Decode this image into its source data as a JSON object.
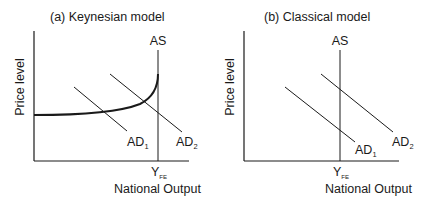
{
  "panels": [
    {
      "id": "a",
      "title": "(a)  Keynesian model",
      "y_axis_label": "Price level",
      "x_axis_label": "National Output",
      "as_label": "AS",
      "x_tick": {
        "main": "Y",
        "sub": "FE"
      },
      "ad_labels": [
        {
          "main": "AD",
          "sub": "1"
        },
        {
          "main": "AD",
          "sub": "2"
        }
      ]
    },
    {
      "id": "b",
      "title": "(b)  Classical model",
      "y_axis_label": "Price level",
      "x_axis_label": "National Output",
      "as_label": "AS",
      "x_tick": {
        "main": "Y",
        "sub": "FE"
      },
      "ad_labels": [
        {
          "main": "AD",
          "sub": "1"
        },
        {
          "main": "AD",
          "sub": "2"
        }
      ]
    }
  ],
  "colors": {
    "line": "#1a1a1a",
    "background": "#ffffff"
  }
}
